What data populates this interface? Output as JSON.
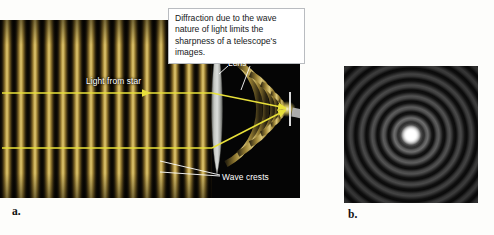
{
  "figure": {
    "callout_text": "Diffraction due to the wave nature of light limits the sharpness of a telescope's images.",
    "panel_a_label": "a.",
    "panel_b_label": "b."
  },
  "labels": {
    "light_from_star": "Light from star",
    "lens": "Lens",
    "wave_crests": "Wave crests"
  },
  "colors": {
    "wave_gold": "#c6a84e",
    "wave_dark": "#050403",
    "ray_yellow": "#e8e03a",
    "lens_gray": "#b9bcb8",
    "arrow_gray": "#b4b4b4",
    "panel_background": "#050505",
    "page_background": "#fdfdfb",
    "label_white": "#ffffff",
    "callout_border": "#b9bcc0"
  },
  "diagram": {
    "panel_a": {
      "description": "Plane light waves from a star pass through a lens and converge to a focus",
      "plane_wave_count": 15,
      "plane_wave_period_px": 14,
      "converging_arc_count": 5,
      "ray_count": 2,
      "lens_x": 217,
      "focal_x": 290
    },
    "panel_b": {
      "description": "Airy diffraction pattern: bright central disk surrounded by concentric rings",
      "ring_count": 14,
      "center_bright": true
    }
  }
}
